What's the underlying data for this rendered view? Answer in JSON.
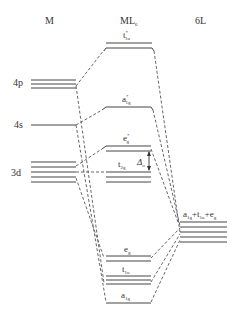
{
  "headers": {
    "metal": "M",
    "complex": "ML",
    "complex_sub": "6",
    "ligand": "6L"
  },
  "metal_orbitals": {
    "p": "4p",
    "s": "4s",
    "d": "3d"
  },
  "mo_labels": {
    "t1u_star": "t",
    "t1u_star_sub": "1u",
    "t1u_star_sup": "*",
    "a1g_star": "a",
    "a1g_star_sub": "1g",
    "a1g_star_sup": "*",
    "eg_star": "e",
    "eg_star_sub": "g",
    "eg_star_sup": "*",
    "t2g": "t",
    "t2g_sub": "2g",
    "eg": "e",
    "eg_sub": "g",
    "t1u": "t",
    "t1u_sub": "1u",
    "a1g": "a",
    "a1g_sub": "1g"
  },
  "delta": {
    "symbol": "Δ",
    "sub": "o"
  },
  "ligand_label": "a1g+t1u+eg",
  "ligand_label_parts": [
    "a",
    "1g",
    "+t",
    "1u",
    "+e",
    "g"
  ]
}
